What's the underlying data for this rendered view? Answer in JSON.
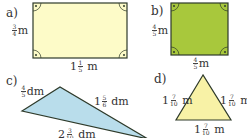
{
  "colors": {
    "a_fill": "#FDFBC8",
    "b_fill": "#A8C83C",
    "c_fill": "#B9DDEB",
    "d_fill": "#F8F2A6",
    "stroke": "#2E3A2A"
  },
  "figures": {
    "a": {
      "label": "a)",
      "shape": "rectangle",
      "height": {
        "whole": "",
        "num": "3",
        "den": "4",
        "unit": "m"
      },
      "width": {
        "whole": "1",
        "num": "1",
        "den": "5",
        "unit": "m"
      }
    },
    "b": {
      "label": "b)",
      "shape": "square",
      "height": {
        "whole": "",
        "num": "4",
        "den": "5",
        "unit": "m"
      },
      "width": {
        "whole": "",
        "num": "4",
        "den": "5",
        "unit": "m"
      }
    },
    "c": {
      "label": "c)",
      "shape": "triangle",
      "side1": {
        "whole": "",
        "num": "4",
        "den": "5",
        "unit": "dm"
      },
      "side2": {
        "whole": "1",
        "num": "5",
        "den": "6",
        "unit": "dm"
      },
      "side3": {
        "whole": "2",
        "num": "3",
        "den": "10",
        "unit": "dm"
      }
    },
    "d": {
      "label": "d)",
      "shape": "equilateral-triangle",
      "left": {
        "whole": "1",
        "num": "7",
        "den": "10",
        "unit": "m"
      },
      "right": {
        "whole": "1",
        "num": "7",
        "den": "10",
        "unit": "m"
      },
      "bottom": {
        "whole": "1",
        "num": "7",
        "den": "10",
        "unit": "m"
      }
    }
  }
}
